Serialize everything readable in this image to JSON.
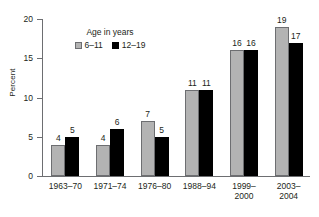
{
  "chart_data": {
    "type": "bar",
    "title": "",
    "xlabel": "",
    "ylabel": "Percent",
    "ylim": [
      0,
      20
    ],
    "yticks": [
      0,
      5,
      10,
      15,
      20
    ],
    "grid": false,
    "legend_position": "inside-top-left",
    "legend_title": "Age in years",
    "categories": [
      "1963–70",
      "1971–74",
      "1976–80",
      "1988–94",
      "1999–\n2000",
      "2003–\n2004"
    ],
    "category_lines": [
      [
        "1963–70"
      ],
      [
        "1971–74"
      ],
      [
        "1976–80"
      ],
      [
        "1988–94"
      ],
      [
        "1999–",
        "2000"
      ],
      [
        "2003–",
        "2004"
      ]
    ],
    "series": [
      {
        "name": "6–11",
        "color": "#b3b3b3",
        "values": [
          4,
          4,
          7,
          11,
          16,
          19
        ]
      },
      {
        "name": "12–19",
        "color": "#000000",
        "values": [
          5,
          6,
          5,
          11,
          16,
          17
        ]
      }
    ]
  },
  "axis": {
    "y_tick_labels": [
      "0",
      "5",
      "10",
      "15",
      "20"
    ],
    "y_title": "Percent"
  },
  "legend": {
    "title": "Age in years",
    "items": [
      {
        "label": "6–11",
        "color": "#b3b3b3"
      },
      {
        "label": "12–19",
        "color": "#000000"
      }
    ]
  },
  "colors": {
    "series_a": "#b3b3b3",
    "series_b": "#000000",
    "axis": "#6d6e71",
    "text": "#231f20",
    "background": "#ffffff"
  }
}
